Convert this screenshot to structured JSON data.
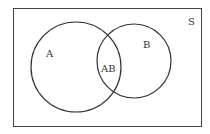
{
  "diagram": {
    "type": "venn",
    "universe_label": "S",
    "sets": [
      {
        "id": "A",
        "label": "A"
      },
      {
        "id": "B",
        "label": "B"
      }
    ],
    "intersection_label": "AB",
    "colors": {
      "stroke": "#333333",
      "background": "#ffffff"
    }
  }
}
